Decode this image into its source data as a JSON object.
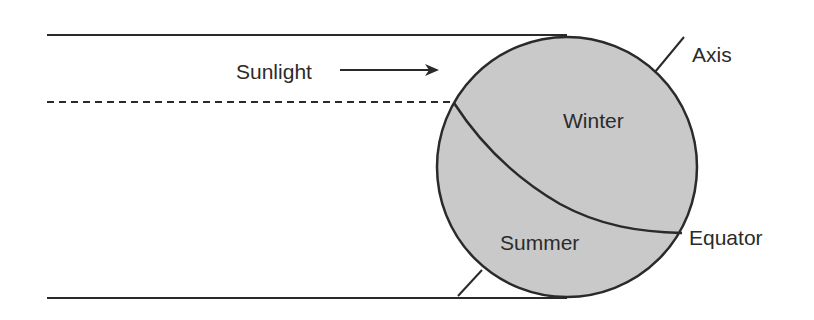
{
  "diagram": {
    "title": "",
    "colors": {
      "background": "#ffffff",
      "line": "#2a2a2a",
      "globe_fill": "#c9c9c9",
      "text": "#2b2b2b"
    },
    "labels": {
      "sunlight": "Sunlight",
      "axis": "Axis",
      "winter": "Winter",
      "summer": "Summer",
      "equator": "Equator"
    },
    "arrow": {
      "direction": "right",
      "icon": "right-arrow-icon"
    },
    "globe": {
      "cx": 567,
      "cy": 167,
      "r": 130
    },
    "rays": {
      "top_solid_y": 35,
      "dashed_y": 102,
      "bottom_solid_y": 298,
      "start_x": 47
    }
  }
}
